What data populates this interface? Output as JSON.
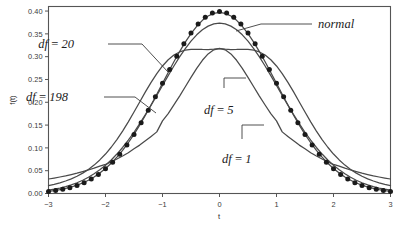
{
  "chart_data": {
    "type": "line",
    "title": "",
    "xlabel": "t",
    "ylabel": "f(t)",
    "xlim": [
      -3,
      3
    ],
    "ylim": [
      0,
      0.41
    ],
    "grid": false,
    "legend_position": "inline-annotations",
    "xticks": [
      "−3",
      "−2",
      "−1",
      "0",
      "1",
      "2",
      "3"
    ],
    "xtick_values": [
      -3,
      -2,
      -1,
      0,
      1,
      2,
      3
    ],
    "yticks": [
      "0.00",
      "0.05",
      "0.10",
      "0.15",
      "0.20",
      "0.25",
      "0.30",
      "0.35",
      "0.40"
    ],
    "ytick_values": [
      0.0,
      0.05,
      0.1,
      0.15,
      0.2,
      0.25,
      0.3,
      0.35,
      0.4
    ],
    "annotations": [
      {
        "text": "normal",
        "series": "normal"
      },
      {
        "text": "df = 20",
        "series": "df20"
      },
      {
        "text": "df = 198",
        "series": "df198"
      },
      {
        "text": "df = 5",
        "series": "df5"
      },
      {
        "text": "df = 1",
        "series": "df1"
      }
    ],
    "x": [
      -3.0,
      -2.9,
      -2.8,
      -2.7,
      -2.6,
      -2.5,
      -2.4,
      -2.3,
      -2.2,
      -2.1,
      -2.0,
      -1.9,
      -1.8,
      -1.7,
      -1.6,
      -1.5,
      -1.4,
      -1.3,
      -1.2,
      -1.1,
      -1.0,
      -0.9,
      -0.8,
      -0.7,
      -0.6,
      -0.5,
      -0.4,
      -0.3,
      -0.2,
      -0.1,
      0.0,
      0.1,
      0.2,
      0.3,
      0.4,
      0.5,
      0.6,
      0.7,
      0.8,
      0.9,
      1.0,
      1.1,
      1.2,
      1.3,
      1.4,
      1.5,
      1.6,
      1.7,
      1.8,
      1.9,
      2.0,
      2.1,
      2.2,
      2.3,
      2.4,
      2.5,
      2.6,
      2.7,
      2.8,
      2.9,
      3.0
    ],
    "series": [
      {
        "name": "normal",
        "style": "markers",
        "peak": 0.3989,
        "values": [
          0.0044,
          0.006,
          0.0079,
          0.0104,
          0.0136,
          0.0175,
          0.0224,
          0.0283,
          0.0355,
          0.044,
          0.054,
          0.0656,
          0.079,
          0.094,
          0.1109,
          0.1295,
          0.1497,
          0.1714,
          0.1942,
          0.2179,
          0.242,
          0.2661,
          0.2897,
          0.3123,
          0.3332,
          0.352,
          0.3683,
          0.3814,
          0.391,
          0.397,
          0.3989,
          0.397,
          0.391,
          0.3814,
          0.3683,
          0.352,
          0.3332,
          0.3123,
          0.2897,
          0.2661,
          0.242,
          0.2179,
          0.1942,
          0.1714,
          0.1497,
          0.1295,
          0.1109,
          0.094,
          0.079,
          0.0656,
          0.054,
          0.044,
          0.0355,
          0.0283,
          0.0224,
          0.0175,
          0.0136,
          0.0104,
          0.0079,
          0.006,
          0.0044
        ]
      },
      {
        "name": "df198",
        "style": "line",
        "peak": 0.3974,
        "values": [
          0.0048,
          0.0064,
          0.0084,
          0.011,
          0.0142,
          0.0182,
          0.0231,
          0.029,
          0.0362,
          0.0447,
          0.0547,
          0.0663,
          0.0796,
          0.0945,
          0.1113,
          0.1298,
          0.1499,
          0.1715,
          0.1941,
          0.2176,
          0.2415,
          0.2654,
          0.2888,
          0.3112,
          0.3319,
          0.3505,
          0.3666,
          0.3796,
          0.3891,
          0.395,
          0.3969,
          0.395,
          0.3891,
          0.3796,
          0.3666,
          0.3505,
          0.3319,
          0.3112,
          0.2888,
          0.2654,
          0.2415,
          0.2176,
          0.1941,
          0.1715,
          0.1499,
          0.1298,
          0.1113,
          0.0945,
          0.0796,
          0.0663,
          0.0547,
          0.0447,
          0.0362,
          0.029,
          0.0231,
          0.0182,
          0.0142,
          0.011,
          0.0084,
          0.0064,
          0.0048
        ]
      },
      {
        "name": "df20",
        "style": "line",
        "peak": 0.394,
        "values": [
          0.0073,
          0.0094,
          0.012,
          0.0152,
          0.019,
          0.0236,
          0.0291,
          0.0355,
          0.0431,
          0.0519,
          0.062,
          0.0735,
          0.0865,
          0.1009,
          0.1169,
          0.1343,
          0.1531,
          0.173,
          0.1938,
          0.2152,
          0.2369,
          0.2585,
          0.2795,
          0.2994,
          0.3177,
          0.334,
          0.3479,
          0.359,
          0.367,
          0.3719,
          0.3735,
          0.3719,
          0.367,
          0.359,
          0.3479,
          0.334,
          0.3177,
          0.2994,
          0.2795,
          0.2585,
          0.2369,
          0.2152,
          0.1938,
          0.173,
          0.1531,
          0.1343,
          0.1169,
          0.1009,
          0.0865,
          0.0735,
          0.062,
          0.0519,
          0.0431,
          0.0355,
          0.0291,
          0.0236,
          0.019,
          0.0152,
          0.012,
          0.0094,
          0.0073
        ]
      },
      {
        "name": "df5",
        "style": "line",
        "peak": 0.3796,
        "values": [
          0.0173,
          0.0201,
          0.0234,
          0.0274,
          0.0322,
          0.0379,
          0.0447,
          0.0528,
          0.0623,
          0.0736,
          0.0865,
          0.1014,
          0.1182,
          0.1368,
          0.1571,
          0.1786,
          0.2007,
          0.2227,
          0.2437,
          0.2629,
          0.2796,
          0.2932,
          0.3035,
          0.3104,
          0.3144,
          0.316,
          0.3162,
          0.3158,
          0.3157,
          0.3163,
          0.3178,
          0.3163,
          0.3157,
          0.3158,
          0.3162,
          0.316,
          0.3144,
          0.3104,
          0.3035,
          0.2932,
          0.2796,
          0.2629,
          0.2437,
          0.2227,
          0.2007,
          0.1786,
          0.1571,
          0.1368,
          0.1182,
          0.1014,
          0.0865,
          0.0736,
          0.0623,
          0.0528,
          0.0447,
          0.0379,
          0.0322,
          0.0274,
          0.0234,
          0.0201,
          0.0173
        ]
      },
      {
        "name": "df1",
        "style": "line",
        "peak": 0.3183,
        "values": [
          0.0318,
          0.0339,
          0.0362,
          0.0387,
          0.0415,
          0.0445,
          0.0479,
          0.0516,
          0.0557,
          0.0602,
          0.0637,
          0.0694,
          0.0755,
          0.0822,
          0.0894,
          0.098,
          0.1061,
          0.1155,
          0.1252,
          0.1351,
          0.1592,
          0.1753,
          0.1941,
          0.2136,
          0.2341,
          0.2546,
          0.2744,
          0.2921,
          0.3061,
          0.3151,
          0.3183,
          0.3151,
          0.3061,
          0.2921,
          0.2744,
          0.2546,
          0.2341,
          0.2136,
          0.1941,
          0.1753,
          0.1592,
          0.1351,
          0.1252,
          0.1155,
          0.1061,
          0.098,
          0.0894,
          0.0822,
          0.0755,
          0.0694,
          0.0637,
          0.0602,
          0.0557,
          0.0516,
          0.0479,
          0.0445,
          0.0415,
          0.0387,
          0.0362,
          0.0339,
          0.0318
        ]
      }
    ]
  },
  "axes": {
    "xlabel": "t",
    "ylabel": "f(t)"
  },
  "labels": {
    "normal": "normal",
    "df20": "df = 20",
    "df198": "df = 198",
    "df5": "df = 5",
    "df1": "df = 1"
  },
  "colors": {
    "curve": "#4a4a4a",
    "marker": "#1a1a1a",
    "spine": "#555555",
    "text": "#1c1c1c",
    "background": "#ffffff"
  }
}
